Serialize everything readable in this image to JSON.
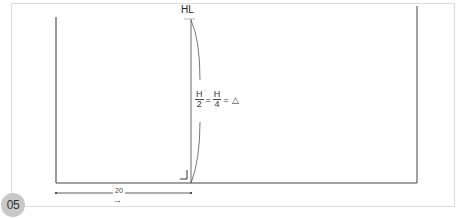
{
  "figure": {
    "step_number": "05",
    "top_label": "HL",
    "formula": {
      "term1_numerator": "H",
      "term1_numerator_mark": "'",
      "term1_denominator": "2",
      "equals1": "=",
      "term2_numerator": "H",
      "term2_denominator": "4",
      "equals2": "=",
      "result_symbol": "△"
    },
    "dimension": {
      "value": "20",
      "arrow": "→"
    },
    "colors": {
      "line": "#333333",
      "panel_border": "#dcdcdc",
      "badge_bg": "#c8c8c8",
      "bracket": "#555555"
    }
  }
}
